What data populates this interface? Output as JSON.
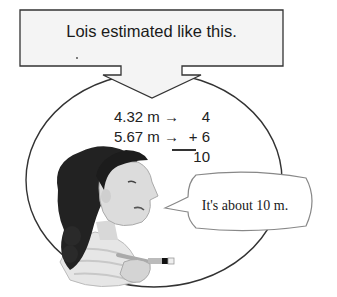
{
  "header_box": {
    "text": "Lois estimated like this."
  },
  "estimation": {
    "rows": [
      {
        "measurement": "4.32 m",
        "arrow": "→",
        "operator": "",
        "rounded": "4"
      },
      {
        "measurement": "5.67 m",
        "arrow": "→",
        "operator": "+",
        "rounded": "6"
      }
    ],
    "sum": "10"
  },
  "speech_bubble": {
    "text": "It's about 10 m."
  },
  "illustration": {
    "subject": "girl-with-braid-holding-paintbrush"
  },
  "colors": {
    "outline": "#333333",
    "box_fill": "#f4f4f4",
    "text": "#1a1a1a"
  }
}
